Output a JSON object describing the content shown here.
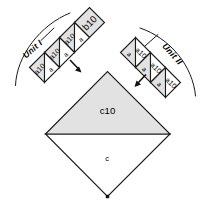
{
  "figure": {
    "background_color": "#ffffff",
    "shaded_color": "#e2e2e2",
    "line_color": "#1a1a1a",
    "unit_one": {
      "bracket_label": "Unit I",
      "cap_square_label": "b10",
      "triangles": [
        {
          "label": "a10",
          "shaded": true,
          "x": 27.5,
          "y": 95.0,
          "rotate": -45
        },
        {
          "label": "a",
          "shaded": false,
          "x": 42.5,
          "y": 95.5,
          "rotate": -45
        },
        {
          "label": "a10",
          "shaded": true,
          "x": 48.0,
          "y": 72.0,
          "rotate": -45
        },
        {
          "label": "a",
          "shaded": false,
          "x": 61.5,
          "y": 72.5,
          "rotate": -45
        },
        {
          "label": "a10",
          "shaded": true,
          "x": 67.5,
          "y": 50.0,
          "rotate": -45
        },
        {
          "label": "a",
          "shaded": false,
          "x": 81.0,
          "y": 50.5,
          "rotate": -45
        }
      ]
    },
    "unit_two": {
      "bracket_label": "Unit II",
      "triangles": [
        {
          "label": "a",
          "shaded": true,
          "x": 128.5,
          "y": 52.0,
          "rotate": 45
        },
        {
          "label": "a10",
          "shaded": false,
          "x": 142.0,
          "y": 50.5,
          "rotate": 45
        },
        {
          "label": "a",
          "shaded": true,
          "x": 150.0,
          "y": 72.5,
          "rotate": 45
        },
        {
          "label": "a10",
          "shaded": false,
          "x": 163.0,
          "y": 72.0,
          "rotate": 45
        },
        {
          "label": "a",
          "shaded": true,
          "x": 171.0,
          "y": 95.0,
          "rotate": 45
        },
        {
          "label": "a10",
          "shaded": false,
          "x": 184.5,
          "y": 94.5,
          "rotate": 45
        }
      ]
    },
    "center": {
      "upper_triangle_label": "c10",
      "lower_region_label": "c"
    },
    "arrows": [
      {
        "name": "unit-one-arrow",
        "direction": "down-right"
      },
      {
        "name": "unit-two-arrow",
        "direction": "down-left"
      }
    ]
  }
}
